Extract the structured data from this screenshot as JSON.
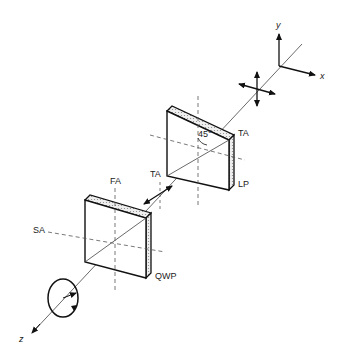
{
  "diagram": {
    "axes": {
      "x": "x",
      "y": "y",
      "z": "z"
    },
    "linear_polarizer": {
      "label": "LP",
      "transmission_axis": "TA",
      "angle": "45°"
    },
    "quarter_wave_plate": {
      "label": "QWP",
      "fast_axis": "FA",
      "slow_axis": "SA"
    },
    "between_plates_axis_label": "TA",
    "input_light": "unpolarized",
    "output_light": "circularly polarized"
  }
}
